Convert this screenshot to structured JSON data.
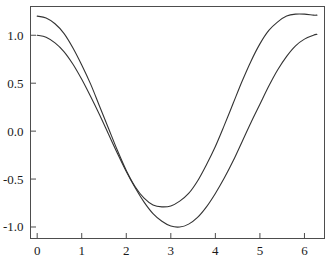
{
  "chart_data": {
    "type": "line",
    "title": "",
    "xlabel": "",
    "ylabel": "",
    "xlim": [
      -0.15,
      6.45
    ],
    "ylim": [
      -1.12,
      1.3
    ],
    "grid": false,
    "legend": null,
    "background_color": "#ffffff",
    "frame_color": "#4d4d4d",
    "xticks": [
      0,
      1,
      2,
      3,
      4,
      5,
      6
    ],
    "xtick_labels": [
      "0",
      "1",
      "2",
      "3",
      "4",
      "5",
      "6"
    ],
    "yticks": [
      1.0,
      0.5,
      0.0,
      -0.5,
      -1.0
    ],
    "ytick_labels": [
      "1.0",
      "0.5",
      "0.0",
      "-0.5",
      "-1.0"
    ],
    "series": [
      {
        "name": "upper-curve",
        "color": "#333333",
        "line_width": 1.1,
        "x": [
          0.0,
          0.2,
          0.4,
          0.6,
          0.8,
          1.0,
          1.2,
          1.4,
          1.6,
          1.8,
          2.0,
          2.2,
          2.4,
          2.6,
          2.8,
          3.0,
          3.2,
          3.4,
          3.6,
          3.8,
          4.0,
          4.2,
          4.4,
          4.6,
          4.8,
          5.0,
          5.2,
          5.4,
          5.6,
          5.8,
          6.0,
          6.2,
          6.28
        ],
        "values": [
          1.2,
          1.18,
          1.12,
          1.02,
          0.87,
          0.69,
          0.49,
          0.26,
          0.03,
          -0.2,
          -0.41,
          -0.58,
          -0.7,
          -0.77,
          -0.79,
          -0.78,
          -0.73,
          -0.65,
          -0.52,
          -0.35,
          -0.16,
          0.06,
          0.29,
          0.52,
          0.73,
          0.91,
          1.05,
          1.14,
          1.2,
          1.22,
          1.22,
          1.21,
          1.21
        ]
      },
      {
        "name": "lower-curve",
        "color": "#333333",
        "line_width": 1.1,
        "x": [
          0.0,
          0.2,
          0.4,
          0.6,
          0.8,
          1.0,
          1.2,
          1.4,
          1.6,
          1.8,
          2.0,
          2.2,
          2.4,
          2.6,
          2.8,
          3.0,
          3.2,
          3.4,
          3.6,
          3.8,
          4.0,
          4.2,
          4.4,
          4.6,
          4.8,
          5.0,
          5.2,
          5.4,
          5.6,
          5.8,
          6.0,
          6.2,
          6.28
        ],
        "values": [
          1.0,
          0.98,
          0.92,
          0.83,
          0.7,
          0.54,
          0.36,
          0.17,
          -0.03,
          -0.23,
          -0.42,
          -0.59,
          -0.74,
          -0.86,
          -0.94,
          -0.99,
          -1.0,
          -0.97,
          -0.9,
          -0.79,
          -0.65,
          -0.49,
          -0.31,
          -0.11,
          0.09,
          0.28,
          0.47,
          0.64,
          0.78,
          0.89,
          0.96,
          1.0,
          1.01
        ]
      }
    ]
  }
}
